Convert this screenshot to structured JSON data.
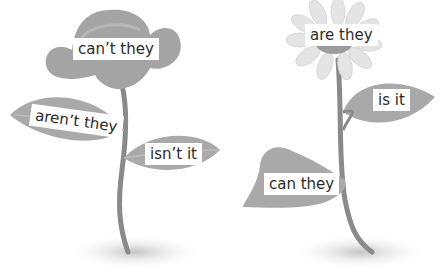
{
  "colors": {
    "leaf": "#a9a9a9",
    "leaf_dark": "#8f8f8f",
    "stem": "#8a8a8a",
    "petal": "#e4e4e4",
    "shadow": "#c8c8c8",
    "label_bg": "#ffffff",
    "label_text": "#2b2b2b"
  },
  "left_plant": {
    "flower_label": "can’t they",
    "left_leaf_label": "aren’t they",
    "right_leaf_label": "isn’t it"
  },
  "right_plant": {
    "flower_label": "are they",
    "upper_leaf_label": "is it",
    "lower_leaf_label": "can they"
  }
}
